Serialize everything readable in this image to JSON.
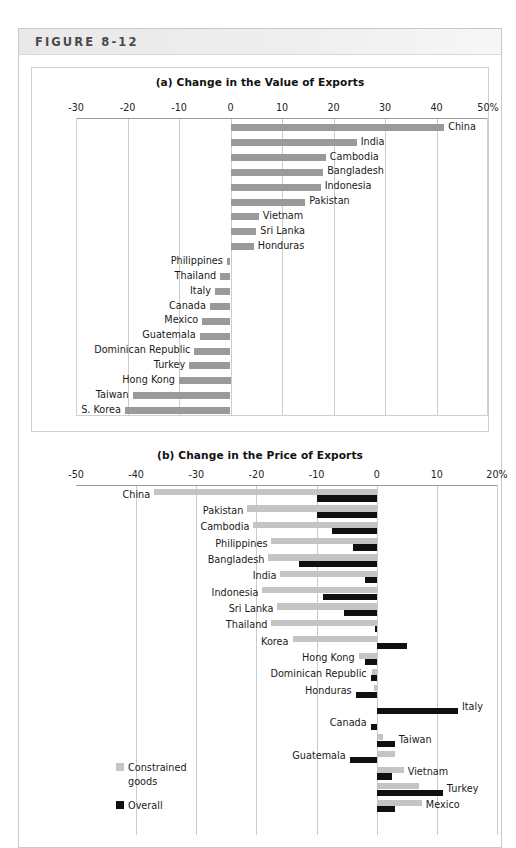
{
  "figure": {
    "label": "FIGURE 8-12"
  },
  "chart_data": [
    {
      "type": "bar",
      "id": "panel-a",
      "title": "(a) Change in the Value of Exports",
      "orientation": "horizontal",
      "xlabel": "",
      "ylabel": "",
      "xlim": [
        -30,
        50
      ],
      "ticks": [
        -30,
        -20,
        -10,
        0,
        10,
        20,
        30,
        40,
        50
      ],
      "tick_labels": [
        "-30",
        "-20",
        "-10",
        "0",
        "10",
        "20",
        "30",
        "40",
        "50%"
      ],
      "grid": true,
      "legend": null,
      "series": [
        {
          "name": "Change in value of exports",
          "color": "#9a9a9a",
          "categories": [
            "China",
            "India",
            "Cambodia",
            "Bangladesh",
            "Indonesia",
            "Pakistan",
            "Vietnam",
            "Sri Lanka",
            "Honduras",
            "Philippines",
            "Thailand",
            "Italy",
            "Canada",
            "Mexico",
            "Guatemala",
            "Dominican Republic",
            "Turkey",
            "Hong Kong",
            "Taiwan",
            "S. Korea"
          ],
          "values": [
            41.5,
            24.5,
            18.5,
            18.0,
            17.5,
            14.5,
            5.5,
            5.0,
            4.5,
            -0.7,
            -2.0,
            -3.0,
            -4.0,
            -5.5,
            -6.0,
            -7.0,
            -8.0,
            -10.0,
            -19.0,
            -20.5
          ]
        }
      ]
    },
    {
      "type": "bar",
      "id": "panel-b",
      "title": "(b) Change in the Price of Exports",
      "orientation": "horizontal",
      "xlabel": "",
      "ylabel": "",
      "xlim": [
        -50,
        20
      ],
      "ticks": [
        -50,
        -40,
        -30,
        -20,
        -10,
        0,
        10,
        20
      ],
      "tick_labels": [
        "-50",
        "-40",
        "-30",
        "-20",
        "-10",
        "0",
        "10",
        "20%"
      ],
      "grid": true,
      "legend": {
        "position": "bottom-left",
        "entries": [
          {
            "label": "Constrained goods",
            "color": "#c4c4c4"
          },
          {
            "label": "Overall",
            "color": "#101010"
          }
        ]
      },
      "categories": [
        "China",
        "Pakistan",
        "Cambodia",
        "Philippines",
        "Bangladesh",
        "India",
        "Indonesia",
        "Sri Lanka",
        "Thailand",
        "Korea",
        "Hong Kong",
        "Dominican Republic",
        "Honduras",
        "Italy",
        "Canada",
        "Taiwan",
        "Guatemala",
        "Vietnam",
        "Turkey",
        "Mexico"
      ],
      "series": [
        {
          "name": "Constrained goods",
          "color": "#c4c4c4",
          "values": [
            -37.0,
            -21.5,
            -20.5,
            -17.5,
            -18.0,
            -16.0,
            -19.0,
            -16.5,
            -17.5,
            -14.0,
            -3.0,
            -0.8,
            -0.5,
            0.0,
            0.0,
            1.0,
            3.0,
            4.5,
            7.0,
            7.5
          ]
        },
        {
          "name": "Overall",
          "color": "#101010",
          "values": [
            -10.0,
            -10.0,
            -7.5,
            -4.0,
            -13.0,
            -2.0,
            -9.0,
            -5.5,
            -0.3,
            5.0,
            -2.0,
            -1.0,
            -3.5,
            13.5,
            -1.0,
            3.0,
            -4.5,
            2.5,
            11.0,
            3.0
          ]
        }
      ]
    }
  ]
}
